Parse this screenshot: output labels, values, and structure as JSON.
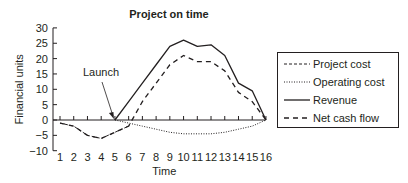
{
  "chart_data": {
    "type": "line",
    "title": "Project on time",
    "xlabel": "Time",
    "ylabel": "Financial units",
    "x": [
      1,
      2,
      3,
      4,
      5,
      6,
      7,
      8,
      9,
      10,
      11,
      12,
      13,
      14,
      15,
      16
    ],
    "ylim": [
      -10,
      30
    ],
    "yticks": [
      -10,
      -5,
      0,
      5,
      10,
      15,
      20,
      25,
      30
    ],
    "xticks": [
      1,
      2,
      3,
      4,
      5,
      6,
      7,
      8,
      9,
      10,
      11,
      12,
      13,
      14,
      15,
      16
    ],
    "grid": false,
    "legend_position": "right",
    "annotations": [
      {
        "text": "Launch",
        "x": 5,
        "y": 0
      }
    ],
    "series": [
      {
        "name": "Project cost",
        "style": "dashed-short",
        "values": [
          -1,
          -2,
          -5,
          -6,
          -4,
          -2,
          null,
          null,
          null,
          null,
          null,
          null,
          null,
          null,
          null,
          null
        ]
      },
      {
        "name": "Operating cost",
        "style": "dotted",
        "values": [
          null,
          null,
          null,
          null,
          0,
          -1,
          -2,
          -3,
          -4,
          -4.5,
          -4.5,
          -4.5,
          -4,
          -3,
          -2,
          0
        ]
      },
      {
        "name": "Revenue",
        "style": "solid",
        "values": [
          null,
          null,
          null,
          null,
          0,
          6,
          12,
          18,
          24,
          26,
          24,
          24.5,
          21,
          12,
          9.5,
          0
        ]
      },
      {
        "name": "Net cash flow",
        "style": "dashed-long",
        "values": [
          -1,
          -2,
          -5,
          -6,
          -4,
          -2,
          6,
          12,
          18,
          21,
          19,
          19,
          16,
          9,
          6,
          0
        ]
      }
    ]
  },
  "title": "Project on time",
  "xlabel": "Time",
  "ylabel": "Financial units",
  "annotation": "Launch",
  "legend": [
    "Project cost",
    "Operating cost",
    "Revenue",
    "Net cash flow"
  ]
}
